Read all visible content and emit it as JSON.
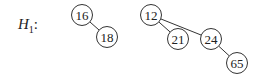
{
  "title": {
    "symbol": "H",
    "subscript": "1",
    "suffix": ":"
  },
  "heap": {
    "name": "H1",
    "trees": [
      {
        "root": "16",
        "nodes": [
          {
            "id": "n16",
            "value": "16",
            "x": 82,
            "y": 15
          },
          {
            "id": "n18",
            "value": "18",
            "x": 107,
            "y": 37
          }
        ],
        "edges": [
          [
            "n16",
            "n18"
          ]
        ]
      },
      {
        "root": "12",
        "nodes": [
          {
            "id": "n12",
            "value": "12",
            "x": 151,
            "y": 15
          },
          {
            "id": "n21",
            "value": "21",
            "x": 178,
            "y": 39
          },
          {
            "id": "n24",
            "value": "24",
            "x": 211,
            "y": 39
          },
          {
            "id": "n65",
            "value": "65",
            "x": 237,
            "y": 63
          }
        ],
        "edges": [
          [
            "n12",
            "n21"
          ],
          [
            "n12",
            "n24"
          ],
          [
            "n24",
            "n65"
          ]
        ]
      }
    ]
  },
  "style": {
    "stroke": "#333333",
    "fill": "#ffffff",
    "radius": 10.5
  }
}
